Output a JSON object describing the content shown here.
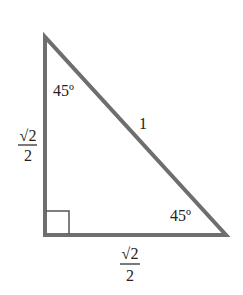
{
  "diagram": {
    "type": "right-triangle",
    "colors": {
      "stroke": "#6e6e6e",
      "text": "#222222",
      "background": "#ffffff"
    },
    "vertices": {
      "top": [
        45,
        37
      ],
      "right_angle": [
        45,
        235
      ],
      "right": [
        226,
        235
      ]
    },
    "angles": {
      "top": "45º",
      "bottom_right": "45º",
      "right_angle_marker": true
    },
    "sides": {
      "hypotenuse": "1",
      "vertical_leg": {
        "numerator": "√2",
        "denominator": "2"
      },
      "horizontal_leg": {
        "numerator": "√2",
        "denominator": "2"
      }
    }
  }
}
